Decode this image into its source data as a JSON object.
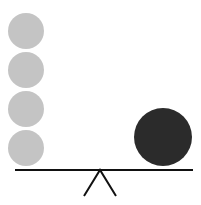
{
  "diagram": {
    "colors": {
      "background": "#ffffff",
      "light_ball": "#c4c4c4",
      "dark_ball": "#2b2b2b",
      "beam": "#111111"
    },
    "light_balls": [
      {
        "cx": 26,
        "cy": 31,
        "r": 18
      },
      {
        "cx": 26,
        "cy": 70,
        "r": 18
      },
      {
        "cx": 26,
        "cy": 109,
        "r": 18
      },
      {
        "cx": 26,
        "cy": 148,
        "r": 18
      }
    ],
    "dark_ball": {
      "cx": 163,
      "cy": 137,
      "r": 29
    },
    "beam": {
      "x1": 15,
      "y1": 170,
      "x2": 193,
      "y2": 170
    },
    "fulcrum": {
      "apex_x": 100,
      "apex_y": 170,
      "left_x": 84,
      "right_x": 116,
      "base_y": 196
    }
  }
}
